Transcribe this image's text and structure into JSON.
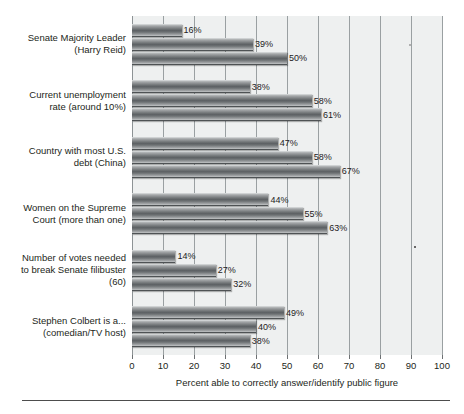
{
  "chart_data": {
    "type": "bar",
    "orientation": "horizontal",
    "title": "",
    "xlabel": "Percent able to correctly answer/identify public figure",
    "ylabel": "",
    "xlim": [
      0,
      100
    ],
    "xticks": [
      0,
      10,
      20,
      30,
      40,
      50,
      60,
      70,
      80,
      90,
      100
    ],
    "xtick_labels": [
      "0",
      "10",
      "20",
      "30",
      "40",
      "50",
      "60",
      "70",
      "80",
      "90",
      "100"
    ],
    "grid": true,
    "legend": "none",
    "value_suffix": "%",
    "categories": [
      "Senate Majority Leader (Harry Reid)",
      "Current unemployment rate (around 10%)",
      "Country with most U.S. debt (China)",
      "Women on the Supreme Court (more than one)",
      "Number of votes needed to break Senate filibuster (60)",
      "Stephen Colbert is a... (comedian/TV host)"
    ],
    "category_lines": [
      [
        "Senate Majority Leader",
        "(Harry Reid)"
      ],
      [
        "Current unemployment",
        "rate (around 10%)"
      ],
      [
        "Country with most U.S.",
        "debt (China)"
      ],
      [
        "Women on the Supreme",
        "Court (more than one)"
      ],
      [
        "Number of votes needed",
        "to break Senate filibuster",
        "(60)"
      ],
      [
        "Stephen Colbert is a...",
        "(comedian/TV host)"
      ]
    ],
    "series": [
      {
        "name": "series-1",
        "values": [
          16,
          38,
          47,
          44,
          14,
          49
        ]
      },
      {
        "name": "series-2",
        "values": [
          39,
          58,
          58,
          55,
          27,
          40
        ]
      },
      {
        "name": "series-3",
        "values": [
          50,
          61,
          67,
          63,
          32,
          38
        ]
      }
    ],
    "labels": [
      [
        "16%",
        "39%",
        "50%"
      ],
      [
        "38%",
        "58%",
        "61%"
      ],
      [
        "47%",
        "58%",
        "67%"
      ],
      [
        "44%",
        "55%",
        "63%"
      ],
      [
        "14%",
        "27%",
        "32%"
      ],
      [
        "49%",
        "40%",
        "38%"
      ]
    ],
    "colors": {
      "bar_fill": "#6e7274",
      "plot_background": "#eef0f0",
      "gridline": "#9aa0a2",
      "text": "#231f20"
    }
  }
}
